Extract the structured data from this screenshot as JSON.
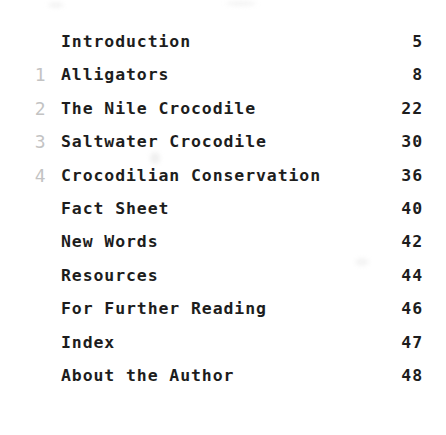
{
  "document": {
    "type": "book-table-of-contents",
    "background_color": "#ffffff",
    "title_color": "#1d1d1d",
    "chapter_number_color": "#c3c3c3"
  },
  "entries": [
    {
      "chapter": "",
      "title": "Introduction",
      "page": "5"
    },
    {
      "chapter": "1",
      "title": "Alligators",
      "page": "8"
    },
    {
      "chapter": "2",
      "title": "The Nile Crocodile",
      "page": "22"
    },
    {
      "chapter": "3",
      "title": "Saltwater Crocodile",
      "page": "30"
    },
    {
      "chapter": "4",
      "title": "Crocodilian Conservation",
      "page": "36"
    },
    {
      "chapter": "",
      "title": "Fact Sheet",
      "page": "40"
    },
    {
      "chapter": "",
      "title": "New Words",
      "page": "42"
    },
    {
      "chapter": "",
      "title": "Resources",
      "page": "44"
    },
    {
      "chapter": "",
      "title": "For Further Reading",
      "page": "46"
    },
    {
      "chapter": "",
      "title": "Index",
      "page": "47"
    },
    {
      "chapter": "",
      "title": "About the Author",
      "page": "48"
    }
  ]
}
